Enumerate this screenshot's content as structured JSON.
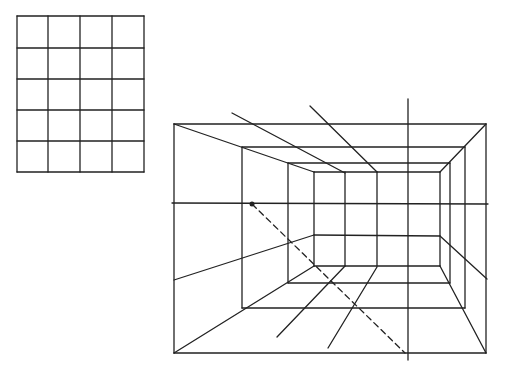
{
  "diagram": {
    "title": "",
    "stroke_color": "#222222",
    "background": "#ffffff",
    "flat_grid": {
      "columns": 4,
      "rows": 5,
      "xs": [
        17,
        48,
        80,
        112,
        144
      ],
      "ys": [
        16,
        48,
        79,
        110,
        141,
        172
      ]
    },
    "perspective_room": {
      "frames": [
        {
          "name": "outer",
          "x1": 174,
          "y1": 124,
          "x2": 486,
          "y2": 353
        },
        {
          "name": "middle",
          "x1": 242,
          "y1": 147,
          "x2": 465,
          "y2": 308
        },
        {
          "name": "inner",
          "x1": 288,
          "y1": 163,
          "x2": 450,
          "y2": 283
        },
        {
          "name": "back-wall",
          "x1": 314,
          "y1": 172,
          "x2": 440,
          "y2": 266
        }
      ],
      "horizon_y": 203,
      "vanishing_dot": {
        "x": 252,
        "y": 204
      },
      "back_wall_verticals_x": [
        345,
        377
      ],
      "back_wall_midline_y": 235,
      "tall_vertical": {
        "x": 408,
        "y1": 99,
        "y2": 360
      },
      "ceiling_rays": [
        {
          "x1": 232,
          "y1": 113,
          "x2": 345,
          "y2": 173
        },
        {
          "x1": 310,
          "y1": 106,
          "x2": 377,
          "y2": 172
        }
      ],
      "wall_rays": [
        {
          "x1": 174,
          "y1": 280,
          "x2": 314,
          "y2": 235
        },
        {
          "x1": 440,
          "y1": 236,
          "x2": 487,
          "y2": 279
        }
      ],
      "floor_rays": [
        {
          "x1": 345,
          "y1": 266,
          "x2": 277,
          "y2": 337
        },
        {
          "x1": 377,
          "y1": 267,
          "x2": 328,
          "y2": 348
        }
      ],
      "dashed_diagonal": {
        "x1": 252,
        "y1": 204,
        "x2": 405,
        "y2": 353
      }
    }
  }
}
